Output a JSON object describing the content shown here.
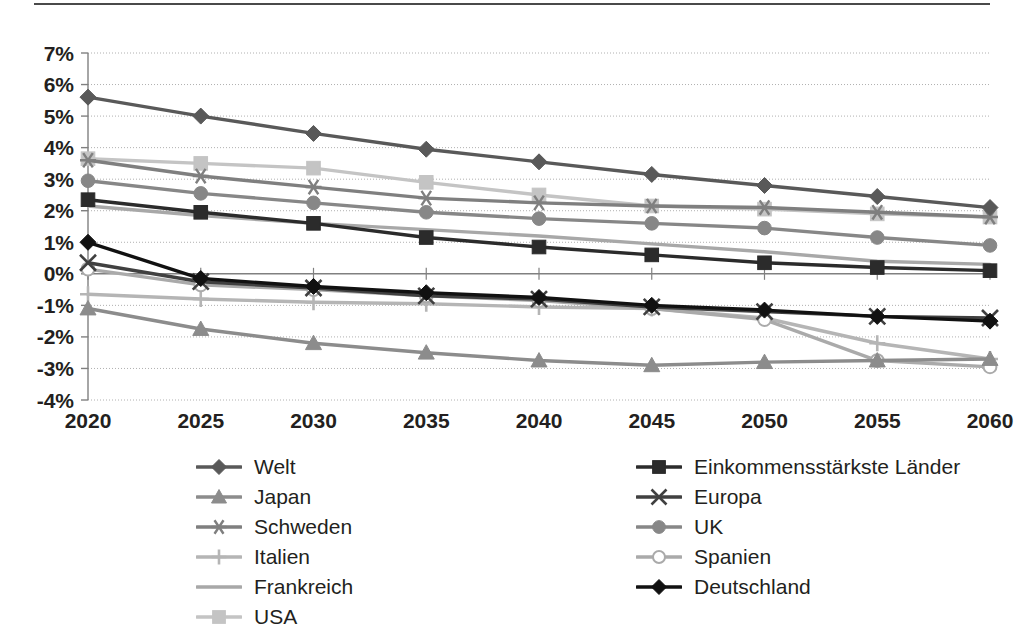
{
  "chart_data": {
    "type": "line",
    "title": "",
    "xlabel": "",
    "ylabel": "",
    "x": [
      2020,
      2025,
      2030,
      2035,
      2040,
      2045,
      2050,
      2055,
      2060
    ],
    "categories": [
      "2020",
      "2025",
      "2030",
      "2035",
      "2040",
      "2045",
      "2050",
      "2055",
      "2060"
    ],
    "ytick_labels": [
      "7%",
      "6%",
      "5%",
      "4%",
      "3%",
      "2%",
      "1%",
      "0%",
      "-1%",
      "-2%",
      "-3%",
      "-4%"
    ],
    "ytick_values": [
      7,
      6,
      5,
      4,
      3,
      2,
      1,
      0,
      -1,
      -2,
      -3,
      -4
    ],
    "ylim": [
      -4,
      7
    ],
    "yunit": "%",
    "grid": true,
    "legend_position": "bottom",
    "series": [
      {
        "name": "Welt",
        "marker": "diamond",
        "color": "#595959",
        "values": [
          5.6,
          5.0,
          4.45,
          3.95,
          3.55,
          3.15,
          2.8,
          2.45,
          2.1
        ]
      },
      {
        "name": "Einkommensstärkste Länder",
        "marker": "square",
        "color": "#2b2b2b",
        "values": [
          2.35,
          1.95,
          1.6,
          1.15,
          0.85,
          0.6,
          0.35,
          0.2,
          0.1
        ]
      },
      {
        "name": "Japan",
        "marker": "triangle",
        "color": "#8c8c8c",
        "values": [
          -1.1,
          -1.75,
          -2.2,
          -2.5,
          -2.75,
          -2.9,
          -2.8,
          -2.75,
          -2.7
        ]
      },
      {
        "name": "Europa",
        "marker": "x",
        "color": "#404040",
        "values": [
          0.35,
          -0.25,
          -0.45,
          -0.7,
          -0.8,
          -1.05,
          -1.2,
          -1.35,
          -1.4
        ]
      },
      {
        "name": "Schweden",
        "marker": "asterisk",
        "color": "#7f7f7f",
        "values": [
          3.6,
          3.1,
          2.75,
          2.4,
          2.25,
          2.15,
          2.1,
          1.95,
          1.8
        ]
      },
      {
        "name": "UK",
        "marker": "circle",
        "color": "#878787",
        "values": [
          2.95,
          2.55,
          2.25,
          1.95,
          1.75,
          1.6,
          1.45,
          1.15,
          0.9
        ]
      },
      {
        "name": "Italien",
        "marker": "plus",
        "color": "#b5b5b5",
        "values": [
          -0.65,
          -0.8,
          -0.9,
          -0.95,
          -1.05,
          -1.1,
          -1.4,
          -2.2,
          -2.7
        ]
      },
      {
        "name": "Spanien",
        "marker": "open-circle",
        "color": "#aaaaaa",
        "values": [
          0.15,
          -0.35,
          -0.5,
          -0.7,
          -0.85,
          -1.1,
          -1.45,
          -2.75,
          -2.95
        ]
      },
      {
        "name": "Frankreich",
        "marker": "none",
        "color": "#a8a8a8",
        "values": [
          2.15,
          1.85,
          1.6,
          1.4,
          1.2,
          0.95,
          0.7,
          0.4,
          0.3
        ]
      },
      {
        "name": "USA",
        "marker": "square",
        "color": "#c4c4c4",
        "values": [
          3.65,
          3.5,
          3.35,
          2.9,
          2.5,
          2.15,
          2.05,
          1.9,
          1.8
        ]
      },
      {
        "name": "Deutschland",
        "marker": "diamond",
        "color": "#111111",
        "values": [
          1.0,
          -0.15,
          -0.4,
          -0.6,
          -0.75,
          -1.0,
          -1.15,
          -1.35,
          -1.5
        ]
      }
    ]
  },
  "legend": {
    "left_column": [
      {
        "label": "Welt",
        "series": "Welt"
      },
      {
        "label": "Japan",
        "series": "Japan"
      },
      {
        "label": "Schweden",
        "series": "Schweden"
      },
      {
        "label": "Italien",
        "series": "Italien"
      },
      {
        "label": "Frankreich",
        "series": "Frankreich"
      },
      {
        "label": "USA",
        "series": "USA"
      }
    ],
    "right_column": [
      {
        "label": "Einkommensstärkste Länder",
        "series": "Einkommensstärkste Länder"
      },
      {
        "label": "Europa",
        "series": "Europa"
      },
      {
        "label": "UK",
        "series": "UK"
      },
      {
        "label": "Spanien",
        "series": "Spanien"
      },
      {
        "label": "Deutschland",
        "series": "Deutschland"
      }
    ]
  },
  "colors": {
    "axis": "#808080",
    "grid": "#b0b0b0",
    "text": "#231f20",
    "top_rule": "#4a4a4a"
  }
}
